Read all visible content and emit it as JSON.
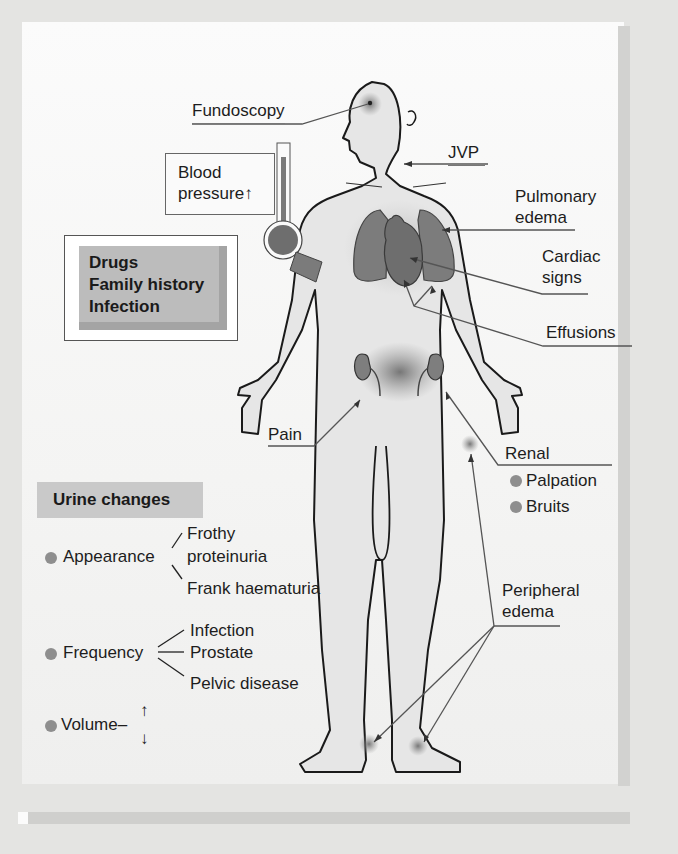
{
  "figure": {
    "labels": {
      "fundoscopy": "Fundoscopy",
      "blood_pressure_line1": "Blood",
      "blood_pressure_line2": "pressure↑",
      "jvp": "JVP",
      "pulmonary_edema_line1": "Pulmonary",
      "pulmonary_edema_line2": "edema",
      "cardiac_signs_line1": "Cardiac",
      "cardiac_signs_line2": "signs",
      "effusions": "Effusions",
      "pain": "Pain",
      "renal": "Renal",
      "peripheral_edema_line1": "Peripheral",
      "peripheral_edema_line2": "edema"
    },
    "renal_items": [
      "Palpation",
      "Bruits"
    ],
    "risk_factors": [
      "Drugs",
      "Family history",
      "Infection"
    ],
    "urine_changes": {
      "heading": "Urine changes",
      "appearance": {
        "label": "Appearance",
        "branches": [
          "Frothy",
          "proteinuria",
          "Frank haematuria"
        ]
      },
      "frequency": {
        "label": "Frequency",
        "branches": [
          "Infection",
          "Prostate",
          "Pelvic disease"
        ]
      },
      "volume": {
        "label": "Volume–",
        "up": "↑",
        "down": "↓"
      }
    }
  }
}
